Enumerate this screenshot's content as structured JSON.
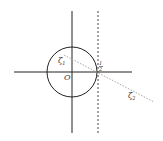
{
  "diagram": {
    "type": "complex-plane-unit-circle",
    "labels": {
      "origin": "O",
      "zeta1": "ζ",
      "zeta1_sub": "1",
      "zeta2": "ζ",
      "zeta2_sub": "2",
      "half_num": "1",
      "half_den": "2"
    },
    "colors": {
      "axes": "#222222",
      "circle": "#222222",
      "dashed_line": "#444444",
      "dotted_line": "#aaaaaa",
      "text": "#333333"
    }
  }
}
